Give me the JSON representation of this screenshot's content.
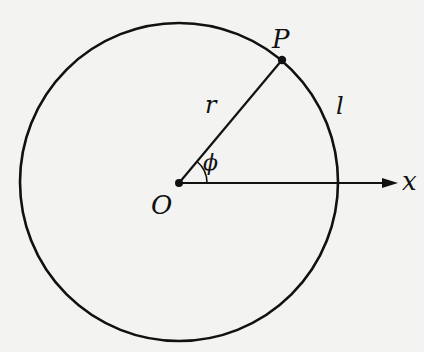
{
  "diagram": {
    "type": "circle-arc-length",
    "colors": {
      "background": "#f3f3f1",
      "stroke": "#111111"
    },
    "circle": {
      "cx": 179,
      "cy": 182,
      "r": 159
    },
    "center_point": {
      "x": 179,
      "y": 183
    },
    "point_P": {
      "x": 282,
      "y": 60
    },
    "x_axis": {
      "x1": 179,
      "y1": 183,
      "x2": 398,
      "y2": 183
    },
    "angle_arc_radius": 28,
    "labels": {
      "P": "P",
      "r": "r",
      "l": "l",
      "phi": "ϕ",
      "O": "O",
      "x": "x"
    }
  }
}
